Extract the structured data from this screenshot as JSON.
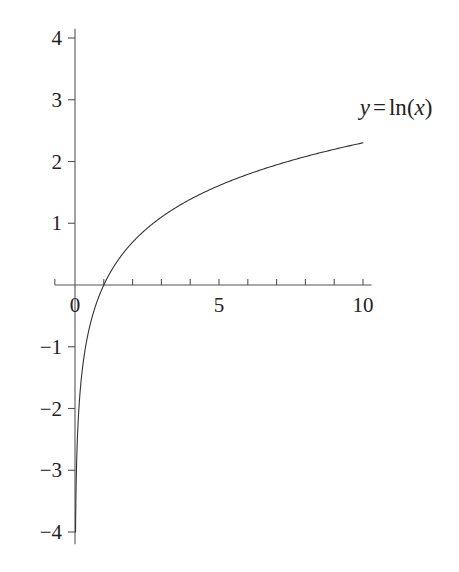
{
  "chart_data": {
    "type": "line",
    "title": "",
    "subtitle": "",
    "xlabel": "",
    "ylabel": "",
    "xlim": [
      -0.7,
      11.0
    ],
    "ylim": [
      -4.15,
      4.15
    ],
    "grid": false,
    "legend_position": "none",
    "annotations": [
      {
        "name": "curve-label",
        "text": "y = ln(x)",
        "parts": {
          "lhs": "y",
          "operator": "=",
          "function": "ln",
          "open_paren": "(",
          "argument": "x",
          "close_paren": ")"
        },
        "x": 11.15,
        "y": 2.88
      }
    ],
    "axes": {
      "x_axis": {
        "name": "x-axis",
        "range_drawn": [
          -0.7,
          10.3
        ],
        "tick_values": [
          0,
          1,
          2,
          3,
          4,
          5,
          6,
          7,
          8,
          9,
          10
        ],
        "tick_labels": [
          "0",
          "",
          "",
          "",
          "",
          "5",
          "",
          "",
          "",
          "",
          "10"
        ],
        "labeled_ticks": [
          {
            "value": 0,
            "label": "0"
          },
          {
            "value": 5,
            "label": "5"
          },
          {
            "value": 10,
            "label": "10"
          }
        ],
        "extra_tick_values": [
          -0.7
        ],
        "tick_direction": "up"
      },
      "y_axis": {
        "name": "y-axis",
        "range_drawn": [
          -4.2,
          4.15
        ],
        "tick_values": [
          -4,
          -3,
          -2,
          -1,
          1,
          2,
          3,
          4
        ],
        "labeled_ticks": [
          {
            "value": 4,
            "label": "4"
          },
          {
            "value": 3,
            "label": "3"
          },
          {
            "value": 2,
            "label": "2"
          },
          {
            "value": 1,
            "label": "1"
          },
          {
            "value": -1,
            "label": "−1"
          },
          {
            "value": -2,
            "label": "−2"
          },
          {
            "value": -3,
            "label": "−3"
          },
          {
            "value": -4,
            "label": "−4"
          }
        ],
        "tick_direction": "left"
      }
    },
    "series": [
      {
        "name": "y = ln(x)",
        "formula": "y = ln(x)",
        "color": "#333333",
        "line_width": 1.1,
        "x_start": 0.0183,
        "x_end": 10.0,
        "x": [
          0.0183,
          0.03,
          0.05,
          0.08,
          0.12,
          0.18,
          0.25,
          0.35,
          0.5,
          0.7,
          1.0,
          1.4,
          1.8,
          2.2,
          2.7,
          3.2,
          3.8,
          4.4,
          5.0,
          5.6,
          6.2,
          6.8,
          7.4,
          8.0,
          8.6,
          9.2,
          10.0
        ],
        "y": [
          -4.0,
          -3.507,
          -2.996,
          -2.526,
          -2.12,
          -1.715,
          -1.386,
          -1.05,
          -0.693,
          -0.357,
          0.0,
          0.336,
          0.588,
          0.788,
          0.993,
          1.163,
          1.335,
          1.482,
          1.609,
          1.723,
          1.825,
          1.917,
          2.001,
          2.079,
          2.152,
          2.219,
          2.303
        ],
        "key_points": [
          {
            "x": 1,
            "y": 0,
            "note": "x-intercept"
          },
          {
            "x": 5,
            "y": 1.609
          },
          {
            "x": 10,
            "y": 2.303,
            "note": "right endpoint"
          },
          {
            "x": 0.0183,
            "y": -4.0,
            "note": "bottom endpoint"
          }
        ]
      }
    ],
    "colors": {
      "background": "#ffffff",
      "axis": "#555555",
      "curve": "#333333",
      "text": "#222222"
    }
  },
  "geometry": {
    "origin_px": {
      "x": 75,
      "y": 285
    },
    "px_per_unit_x": 28.8,
    "px_per_unit_y": 61.75
  }
}
